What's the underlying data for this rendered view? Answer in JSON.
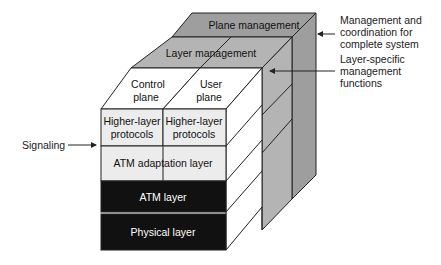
{
  "diagram": {
    "colors": {
      "plane_management": "#9e9e9e",
      "layer_management": "#b4b4b4",
      "plane_face": "#ffffff",
      "upper_layers": "#ececec",
      "atm_layer": "#111111",
      "physical_layer": "#111111",
      "outline": "#222222"
    },
    "top": {
      "plane_management": "Plane management",
      "layer_management": "Layer management",
      "control_plane_line1": "Control",
      "control_plane_line2": "plane",
      "user_plane_line1": "User",
      "user_plane_line2": "plane"
    },
    "front": {
      "higher_layer_control_line1": "Higher-layer",
      "higher_layer_control_line2": "protocols",
      "higher_layer_user_line1": "Higher-layer",
      "higher_layer_user_line2": "protocols",
      "atm_adaptation_layer": "ATM adaptation layer",
      "atm_layer": "ATM layer",
      "physical_layer": "Physical layer"
    },
    "annotations": {
      "plane_mgmt_line1": "Management and",
      "plane_mgmt_line2": "coordination for",
      "plane_mgmt_line3": "complete system",
      "layer_mgmt_line1": "Layer-specific",
      "layer_mgmt_line2": "management",
      "layer_mgmt_line3": "functions",
      "signaling": "Signaling"
    }
  }
}
